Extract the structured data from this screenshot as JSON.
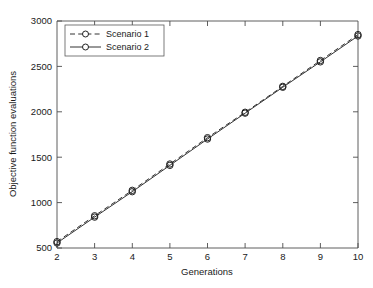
{
  "chart_data": {
    "type": "line",
    "title": "",
    "xlabel": "Generations",
    "ylabel": "Objective function evaluations",
    "x": [
      2,
      3,
      4,
      5,
      6,
      7,
      8,
      9,
      10
    ],
    "xlim": [
      2,
      10
    ],
    "ylim": [
      500,
      3000
    ],
    "xticks": [
      2,
      3,
      4,
      5,
      6,
      7,
      8,
      9,
      10
    ],
    "yticks": [
      500,
      1000,
      1500,
      2000,
      2500,
      3000
    ],
    "xtick_labels": [
      "2",
      "3",
      "4",
      "5",
      "6",
      "7",
      "8",
      "9",
      "10"
    ],
    "ytick_labels": [
      "500",
      "1000",
      "1500",
      "2000",
      "2500",
      "3000"
    ],
    "grid": false,
    "legend_position": "upper left",
    "series": [
      {
        "name": "Scenario 1",
        "style": "dashed",
        "marker": "circle",
        "values": [
          570,
          855,
          1135,
          1425,
          1715,
          1995,
          2280,
          2565,
          2850
        ]
      },
      {
        "name": "Scenario 2",
        "style": "solid",
        "marker": "circle",
        "values": [
          555,
          840,
          1120,
          1410,
          1700,
          1985,
          2270,
          2550,
          2835
        ]
      }
    ]
  },
  "legend": {
    "entries": [
      {
        "label": "Scenario 1"
      },
      {
        "label": "Scenario 2"
      }
    ]
  },
  "axes": {
    "x_title": "Generations",
    "y_title": "Objective function evaluations"
  }
}
